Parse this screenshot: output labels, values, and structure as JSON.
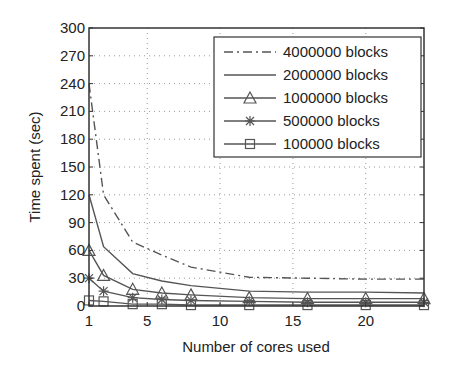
{
  "chart_data": {
    "type": "line",
    "title": "",
    "xlabel": "Number of cores used",
    "ylabel": "Time spent (sec)",
    "x": [
      1,
      2,
      4,
      6,
      8,
      12,
      16,
      20,
      24
    ],
    "xlim": [
      1,
      24
    ],
    "ylim": [
      0,
      300
    ],
    "xticks": [
      1,
      5,
      10,
      15,
      20
    ],
    "yticks": [
      0,
      30,
      60,
      90,
      120,
      150,
      180,
      210,
      240,
      270,
      300
    ],
    "grid": true,
    "legend_position": "upper right",
    "series": [
      {
        "name": "4000000 blocks",
        "style": "dash-dot",
        "marker": "none",
        "values": [
          240,
          120,
          69,
          55,
          42,
          31,
          30,
          29,
          29
        ]
      },
      {
        "name": "2000000 blocks",
        "style": "solid",
        "marker": "none",
        "values": [
          120,
          64,
          35,
          27,
          22,
          16,
          15,
          15,
          14
        ]
      },
      {
        "name": "1000000 blocks",
        "style": "solid",
        "marker": "triangle",
        "values": [
          60,
          33,
          18,
          14,
          12,
          9,
          8,
          8,
          8
        ]
      },
      {
        "name": "500000 blocks",
        "style": "solid",
        "marker": "star",
        "values": [
          30,
          16,
          9,
          7,
          6,
          5,
          4,
          4,
          4
        ]
      },
      {
        "name": "100000 blocks",
        "style": "solid",
        "marker": "square",
        "values": [
          6,
          5,
          2,
          2,
          1,
          1,
          1,
          1,
          1
        ]
      }
    ]
  }
}
